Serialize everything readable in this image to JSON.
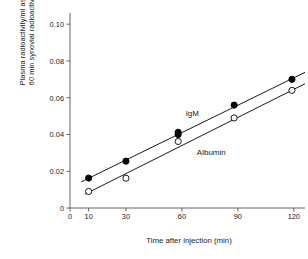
{
  "chart_data": {
    "type": "scatter",
    "title": "",
    "xlabel": "Time after injection (min)",
    "ylabel": "Plasma radioactivity/ml as % of\n60 min synovial radioactivity/ml",
    "xlim": [
      0,
      126
    ],
    "ylim": [
      0,
      0.105
    ],
    "grid": false,
    "legend_position": "inline-annotation",
    "xticks": [
      0,
      10,
      30,
      60,
      90,
      120
    ],
    "xtick_labels": [
      "0",
      "10",
      "30",
      "60",
      "90",
      "120"
    ],
    "yticks": [
      0,
      0.02,
      0.04,
      0.06,
      0.08,
      0.1
    ],
    "ytick_labels": [
      "0",
      "0.02",
      "0.04",
      "0.06",
      "0.08",
      "0.10"
    ],
    "series": [
      {
        "name": "IgM",
        "marker": "filled-circle",
        "color": "#000000",
        "x": [
          10,
          30,
          58,
          58,
          88,
          119
        ],
        "values": [
          0.0163,
          0.0255,
          0.04,
          0.0412,
          0.056,
          0.07
        ],
        "fit_line": {
          "x": [
            6,
            126
          ],
          "y": [
            0.0142,
            0.0738
          ]
        }
      },
      {
        "name": "Albumin",
        "marker": "open-circle",
        "color": "#000000",
        "x": [
          10,
          30,
          58,
          88,
          119
        ],
        "values": [
          0.009,
          0.0162,
          0.0362,
          0.049,
          0.064
        ],
        "fit_line": {
          "x": [
            8,
            126
          ],
          "y": [
            0.0075,
            0.0676
          ]
        }
      }
    ],
    "annotations": [
      {
        "text": "IgM",
        "x": 62,
        "y": 0.0512
      },
      {
        "text": "Albumin",
        "x": 68,
        "y": 0.03
      }
    ]
  }
}
